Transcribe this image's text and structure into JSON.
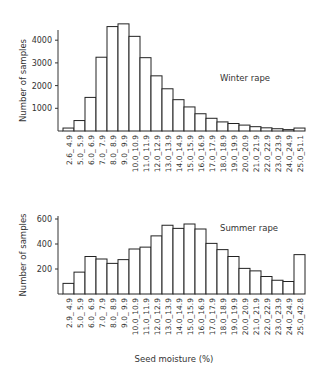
{
  "chart_data": [
    {
      "type": "bar",
      "title": "Winter rape",
      "xlabel": "",
      "ylabel": "Number of samples",
      "ylim": [
        0,
        5000
      ],
      "yticks": [
        1000,
        2000,
        3000,
        4000
      ],
      "grid": false,
      "categories": [
        "2.6-4.9",
        "5.0-5.9",
        "6.0-6.9",
        "7.0-7.9",
        "8.0-8.9",
        "9.0-9.9",
        "10.0-10.9",
        "11.0-11.9",
        "12.0-12.9",
        "13.0-13.9",
        "14.0-14.9",
        "15.0-15.9",
        "16.0-16.9",
        "17.0-17.9",
        "18.0-18.9",
        "19.0-19.9",
        "20.0-20.9",
        "21.0-21.9",
        "22.0-22.9",
        "23.0-23.9",
        "24.0-24.9",
        "25.0-51.1"
      ],
      "tick_labels": [
        "2.6_ 4.9",
        "5.0_ 5.9",
        "6.0_ 6.9",
        "7.0_ 7.9",
        "8.0_ 8.9",
        "9.0_ 9.9",
        "10.0_10.9",
        "11.0_11.9",
        "12.0_12.9",
        "13.0_13.9",
        "14.0_14.9",
        "15.0_15.9",
        "16.0_16.9",
        "17.0_17.9",
        "18.0_18.9",
        "19.0_19.9",
        "20.0_20.9",
        "21.0_21.9",
        "22.0_22.9",
        "23.0_23.9",
        "24.0_24.9",
        "25.0_51.1"
      ],
      "values": [
        130,
        460,
        1480,
        3250,
        4600,
        4720,
        4170,
        3230,
        2430,
        1860,
        1380,
        1060,
        760,
        560,
        400,
        330,
        260,
        190,
        140,
        100,
        60,
        130
      ]
    },
    {
      "type": "bar",
      "title": "Summer rape",
      "xlabel": "Seed moisture (%)",
      "ylabel": "Number of samples",
      "ylim": [
        0,
        620
      ],
      "yticks": [
        200,
        400,
        600
      ],
      "grid": false,
      "categories": [
        "2.9-4.9",
        "5.0-5.9",
        "6.0-6.9",
        "7.0-7.9",
        "8.0-8.9",
        "9.0-9.9",
        "10.0-10.9",
        "11.0-11.9",
        "12.0-12.9",
        "13.0-13.9",
        "14.0-14.9",
        "15.0-15.9",
        "16.0-16.9",
        "17.0-17.9",
        "18.0-18.9",
        "19.0-19.9",
        "20.0-20.9",
        "21.0-21.9",
        "22.0-22.9",
        "23.0-23.9",
        "24.0-24.9",
        "25.0-42.8"
      ],
      "tick_labels": [
        "2.9_ 4.9",
        "5.0_ 5.9",
        "6.0_ 6.9",
        "7.0_ 7.9",
        "8.0_ 8.9",
        "9.0_ 9.9",
        "10.0_10.9",
        "11.0_11.9",
        "12.0_12.9",
        "13.0_13.9",
        "14.0_14.9",
        "15.0_15.9",
        "16.0_16.9",
        "17.0_17.9",
        "18.0_18.9",
        "19.0_19.9",
        "20.0_20.9",
        "21.0_21.9",
        "22.0_22.9",
        "23.0_23.9",
        "24.0_24.9",
        "25.0_42.8"
      ],
      "values": [
        85,
        175,
        300,
        280,
        245,
        275,
        360,
        375,
        465,
        550,
        525,
        560,
        520,
        405,
        355,
        300,
        205,
        185,
        140,
        110,
        100,
        315
      ]
    }
  ]
}
